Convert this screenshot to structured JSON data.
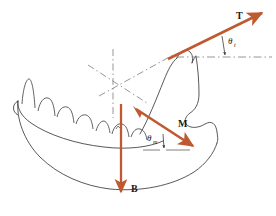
{
  "figure": {
    "background_color": "#ffffff",
    "vector_color": "#bf5a30",
    "outline_color": "#3a3a3a",
    "construction_color": "#8a8a8a"
  },
  "vectors": [
    {
      "id": "T",
      "label": "T",
      "name": "tooth-bite-force-vector",
      "description": "Bite (tooth) force acting up and to the right",
      "x1": 171,
      "y1": 57,
      "x2": 266,
      "y2": 11
    },
    {
      "id": "M",
      "label": "M",
      "name": "muscle-force-vector",
      "description": "Muscle force acting down and to the right",
      "x1": 137,
      "y1": 110,
      "x2": 196,
      "y2": 148
    },
    {
      "id": "B",
      "label": "B",
      "name": "joint-reaction-force-vector",
      "description": "Joint reaction force acting vertically downward",
      "x1": 121,
      "y1": 104,
      "x2": 121,
      "y2": 196
    }
  ],
  "angles": [
    {
      "id": "theta_t",
      "symbol": "θ",
      "subscript": "t",
      "name": "angle-theta-t",
      "description": "Angle of bite force T above the horizontal reference line",
      "label_x": 228,
      "label_y": 42
    },
    {
      "id": "theta_m",
      "symbol": "θ",
      "subscript": "m",
      "name": "angle-theta-m",
      "description": "Angle of muscle force M below the horizontal reference line",
      "label_x": 150,
      "label_y": 140
    }
  ],
  "reference_lines": [
    {
      "id": "horizontal_T",
      "name": "horizontal-reference-line-t",
      "style": "dash-dot",
      "x1": 171,
      "y1": 57,
      "x2": 271,
      "y2": 57
    },
    {
      "id": "horizontal_M",
      "name": "horizontal-reference-line-m",
      "style": "solid-gray",
      "x1": 143,
      "y1": 150,
      "x2": 190,
      "y2": 150
    },
    {
      "id": "vertical_axis",
      "name": "vertical-construction-axis",
      "style": "dash-dot",
      "x1": 113,
      "y1": 49,
      "x2": 113,
      "y2": 118
    },
    {
      "id": "diagonal_left",
      "name": "diagonal-construction-line-left",
      "style": "dash-dot",
      "x1": 88,
      "y1": 65,
      "x2": 145,
      "y2": 101
    },
    {
      "id": "diagonal_to_T",
      "name": "diagonal-construction-line-to-t",
      "style": "dash-dot",
      "x1": 101,
      "y1": 97,
      "x2": 171,
      "y2": 57
    }
  ],
  "caption": {
    "text": ""
  }
}
